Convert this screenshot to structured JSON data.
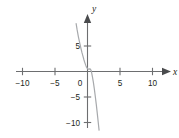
{
  "chart_data": {
    "type": "line",
    "title": "",
    "subtitle": "",
    "xlabel": "x",
    "ylabel": "y",
    "xlim": [
      -11.5,
      11.5
    ],
    "ylim": [
      -11.5,
      9.5
    ],
    "grid": false,
    "legend": null,
    "x_ticks": [
      {
        "value": -10,
        "label": "−10"
      },
      {
        "value": -5,
        "label": "−5"
      },
      {
        "value": 5,
        "label": "5"
      },
      {
        "value": 10,
        "label": "10"
      }
    ],
    "y_ticks": [
      {
        "value": 5,
        "label": "5"
      },
      {
        "value": -5,
        "label": "−5"
      },
      {
        "value": -10,
        "label": "−10"
      }
    ],
    "origin_label": "0",
    "axis_arrows": [
      "x-positive",
      "y-positive"
    ],
    "series": [
      {
        "name": "cubic curve",
        "color": "#a7a9ac",
        "points": [
          [
            -1.75,
            9.4
          ],
          [
            -1.6,
            8.2
          ],
          [
            -1.4,
            6.8
          ],
          [
            -1.2,
            5.6
          ],
          [
            -1.0,
            4.5
          ],
          [
            -0.85,
            3.7
          ],
          [
            -0.7,
            3.0
          ],
          [
            -0.55,
            2.3
          ],
          [
            -0.4,
            1.7
          ],
          [
            -0.28,
            1.25
          ],
          [
            -0.15,
            0.85
          ],
          [
            0.0,
            0.55
          ],
          [
            0.12,
            0.45
          ],
          [
            0.24,
            0.45
          ],
          [
            0.34,
            0.52
          ],
          [
            0.44,
            0.48
          ],
          [
            0.54,
            0.25
          ],
          [
            0.64,
            -0.25
          ],
          [
            0.76,
            -1.05
          ],
          [
            0.9,
            -2.1
          ],
          [
            1.05,
            -3.4
          ],
          [
            1.2,
            -4.9
          ],
          [
            1.35,
            -6.45
          ],
          [
            1.5,
            -8.15
          ],
          [
            1.65,
            -9.95
          ],
          [
            1.78,
            -11.5
          ]
        ]
      }
    ],
    "colors": {
      "axis": "#6d6e70",
      "arrow": "#4a4b4d",
      "curve": "#a7a9ac",
      "text": "#231f20",
      "background": "#ffffff"
    }
  }
}
